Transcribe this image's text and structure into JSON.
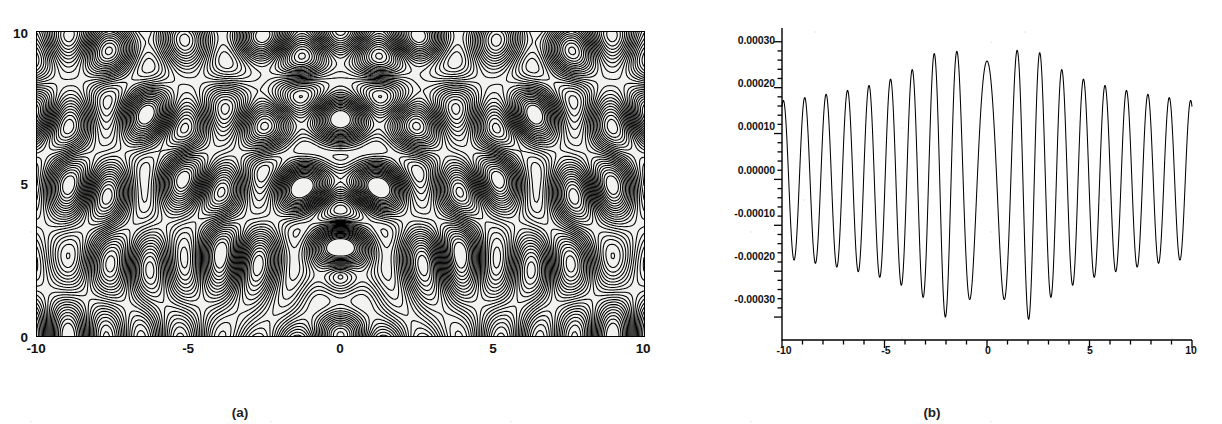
{
  "figure": {
    "background_color": "#ffffff",
    "line_color": "#000000",
    "panel_a_fill": "#f2f2f0"
  },
  "panels": [
    {
      "id": "a",
      "caption": "(a)",
      "type": "contour",
      "xticklabels": [
        "-10",
        "-5",
        "0",
        "5",
        "10"
      ],
      "yticklabels": [
        "0",
        "5",
        "10"
      ]
    },
    {
      "id": "b",
      "caption": "(b)",
      "type": "line",
      "xticklabels": [
        "-10",
        "-5",
        "0",
        "5",
        "10"
      ],
      "yticklabels": [
        "0.00030",
        "0.00020",
        "0.00010",
        "0.00000",
        "-0.00010",
        "-0.00020",
        "-0.00030"
      ]
    }
  ],
  "chart_data": [
    {
      "type": "heatmap",
      "subtype": "contour",
      "panel": "a",
      "title": "",
      "subtitle": "(a)",
      "xlabel": "",
      "ylabel": "",
      "xlim": [
        -10,
        10
      ],
      "ylim": [
        0,
        10
      ],
      "xticks": [
        -10,
        -5,
        0,
        5,
        10
      ],
      "yticks": [
        0,
        5,
        10
      ],
      "xticklabels": [
        "-10",
        "-5",
        "0",
        "5",
        "10"
      ],
      "yticklabels": [
        "0",
        "5",
        "10"
      ],
      "grid": false,
      "legend": false,
      "frame": "box",
      "description": "Dense oscillatory interference-fringe contour map. Concentric rings converge on a focal point near (0, 2); broad parabolic arcs open upward above the focus; elongated cellular contour cells tile the left and right flanks along diagonal bands.",
      "focus_point": [
        0,
        2
      ],
      "contour_levels": 24,
      "annotations": []
    },
    {
      "type": "line",
      "panel": "b",
      "title": "",
      "subtitle": "(b)",
      "xlabel": "",
      "ylabel": "",
      "xlim": [
        -10,
        10
      ],
      "ylim": [
        -0.00035,
        0.00033
      ],
      "xticks": [
        -10,
        -5,
        0,
        5,
        10
      ],
      "yticks": [
        0.0003,
        0.0002,
        0.0001,
        0.0,
        -0.0001,
        -0.0002,
        -0.0003
      ],
      "xticklabels": [
        "-10",
        "-5",
        "0",
        "5",
        "10"
      ],
      "yticklabels": [
        "0.00030",
        "0.00020",
        "0.00010",
        "0.00000",
        "-0.00010",
        "-0.00020",
        "-0.00030"
      ],
      "minor_ticks_y": 4,
      "grid": false,
      "legend": false,
      "frame": "left-bottom",
      "description": "Rapidly oscillating real-valued cross-section. A single broad central lobe spans roughly -1 to 1 with peak 0.00026; the oscillation amplitude envelope maxima occur near x = -2 and x = +2 at about 0.00030-0.00031, then decays monotonically outward to about 0.00017 at |x| = 10.",
      "envelope": {
        "x": [
          -10,
          -9,
          -8,
          -7,
          -6,
          -5,
          -4,
          -3,
          -2,
          -1,
          0,
          1,
          2,
          3,
          4,
          5,
          6,
          7,
          8,
          9,
          10
        ],
        "amplitude": [
          0.000172,
          0.000178,
          0.000185,
          0.000193,
          0.000203,
          0.000215,
          0.000232,
          0.000258,
          0.0003,
          0.000262,
          0.000258,
          0.000262,
          0.000305,
          0.000258,
          0.000232,
          0.000215,
          0.000203,
          0.000193,
          0.000185,
          0.000178,
          0.000172
        ]
      },
      "series": [
        {
          "name": "cross-section",
          "color": "#000000",
          "linewidth": 1,
          "x": [
            -10.0,
            -9.8,
            -9.6,
            -9.4,
            -9.2,
            -9.0,
            -8.8,
            -8.6,
            -8.4,
            -8.2,
            -8.0,
            -7.8,
            -7.6,
            -7.4,
            -7.2,
            -7.0,
            -6.8,
            -6.6,
            -6.4,
            -6.2,
            -6.0,
            -5.8,
            -5.6,
            -5.4,
            -5.2,
            -5.0,
            -4.8,
            -4.6,
            -4.4,
            -4.2,
            -4.0,
            -3.8,
            -3.6,
            -3.4,
            -3.2,
            -3.0,
            -2.8,
            -2.6,
            -2.4,
            -2.2,
            -2.0,
            -1.8,
            -1.6,
            -1.4,
            -1.2,
            -1.0,
            -0.8,
            -0.6,
            -0.4,
            -0.2,
            0.0,
            0.2,
            0.4,
            0.6,
            0.8,
            1.0,
            1.2,
            1.4,
            1.6,
            1.8,
            2.0,
            2.2,
            2.4,
            2.6,
            2.8,
            3.0,
            3.2,
            3.4,
            3.6,
            3.8,
            4.0,
            4.2,
            4.4,
            4.6,
            4.8,
            5.0,
            5.2,
            5.4,
            5.6,
            5.8,
            6.0,
            6.2,
            6.4,
            6.6,
            6.8,
            7.0,
            7.2,
            7.4,
            7.6,
            7.8,
            8.0,
            8.2,
            8.4,
            8.6,
            8.8,
            9.0,
            9.2,
            9.4,
            9.6,
            9.8,
            10.0
          ],
          "note": "y = envelope(x) * cos(phase(x)); about 19 full oscillations across the domain with a phase stall producing the wide central lobe"
        }
      ]
    }
  ]
}
